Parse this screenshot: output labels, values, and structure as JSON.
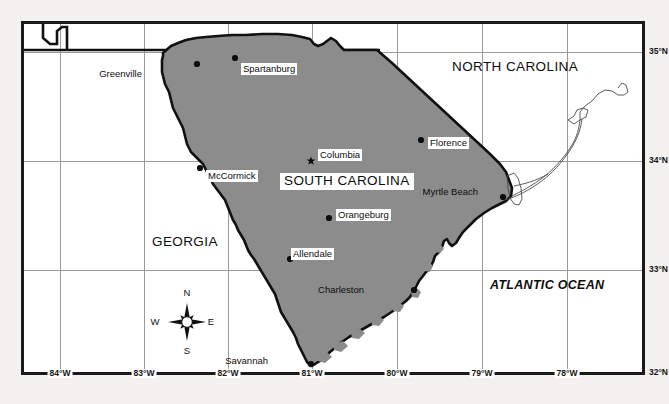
{
  "map": {
    "title": "South Carolina Reference Map",
    "subject_state": "SOUTH CAROLINA",
    "colors": {
      "state_fill": "#8c8c8c",
      "background": "#f2f1ef",
      "border": "#111111",
      "grid": "#9a9a9a",
      "text": "#0d0d0d"
    },
    "extent": {
      "west": -84.6,
      "east": -77.6,
      "south": 31.85,
      "north": 35.35
    }
  },
  "region_labels": [
    {
      "name": "north-carolina",
      "text": "NORTH CAROLINA",
      "x": 452,
      "y": 60,
      "style": "plain"
    },
    {
      "name": "georgia",
      "text": "GEORGIA",
      "x": 152,
      "y": 235,
      "style": "plain"
    },
    {
      "name": "south-carolina",
      "text": "SOUTH CAROLINA",
      "x": 280,
      "y": 173,
      "style": "boxed"
    },
    {
      "name": "atlantic-ocean",
      "text": "ATLANTIC OCEAN",
      "x": 490,
      "y": 279,
      "style": "ocean"
    }
  ],
  "cities": [
    {
      "name": "greenville",
      "label": "Greenville",
      "dot_x": 197,
      "dot_y": 64,
      "label_x": 144,
      "label_y": 68,
      "marker": "dot",
      "label_side": "left"
    },
    {
      "name": "spartanburg",
      "label": "Spartanburg",
      "dot_x": 235,
      "dot_y": 58,
      "label_x": 241,
      "label_y": 63,
      "marker": "dot",
      "label_side": "right"
    },
    {
      "name": "mccormick",
      "label": "McCormick",
      "dot_x": 200,
      "dot_y": 168,
      "label_x": 206,
      "label_y": 170,
      "marker": "dot",
      "label_side": "right"
    },
    {
      "name": "columbia",
      "label": "Columbia",
      "dot_x": 311,
      "dot_y": 161,
      "label_x": 318,
      "label_y": 149,
      "marker": "star",
      "label_side": "right"
    },
    {
      "name": "florence",
      "label": "Florence",
      "dot_x": 421,
      "dot_y": 140,
      "label_x": 428,
      "label_y": 137,
      "marker": "dot",
      "label_side": "right"
    },
    {
      "name": "myrtle-beach",
      "label": "Myrtle Beach",
      "dot_x": 503,
      "dot_y": 197,
      "label_x": 478,
      "label_y": 187,
      "marker": "dot",
      "label_side": "left"
    },
    {
      "name": "orangeburg",
      "label": "Orangeburg",
      "dot_x": 329,
      "dot_y": 218,
      "label_x": 336,
      "label_y": 209,
      "marker": "dot",
      "label_side": "right"
    },
    {
      "name": "allendale",
      "label": "Allendale",
      "dot_x": 290,
      "dot_y": 259,
      "label_x": 291,
      "label_y": 248,
      "marker": "dot",
      "label_side": "right"
    },
    {
      "name": "charleston",
      "label": "Charleston",
      "dot_x": 414,
      "dot_y": 290,
      "label_x": 364,
      "label_y": 285,
      "marker": "dot",
      "label_side": "left"
    },
    {
      "name": "savannah",
      "label": "Savannah",
      "dot_x": 311,
      "dot_y": 364,
      "label_x": 268,
      "label_y": 356,
      "marker": "dot",
      "label_side": "left"
    }
  ],
  "graticule": {
    "longitudes": [
      {
        "label": "84°W",
        "value": -84,
        "x": 60
      },
      {
        "label": "83°W",
        "value": -83,
        "x": 144
      },
      {
        "label": "82°W",
        "value": -82,
        "x": 228
      },
      {
        "label": "81°W",
        "value": -81,
        "x": 312
      },
      {
        "label": "80°W",
        "value": -80,
        "x": 397
      },
      {
        "label": "79°W",
        "value": -79,
        "x": 482
      },
      {
        "label": "78°W",
        "value": -78,
        "x": 567
      }
    ],
    "latitudes": [
      {
        "label": "35°N",
        "value": 35,
        "y": 52
      },
      {
        "label": "34°N",
        "value": 34,
        "y": 161
      },
      {
        "label": "33°N",
        "value": 33,
        "y": 270
      },
      {
        "label": "32°N",
        "value": 32,
        "y": 373
      }
    ]
  },
  "compass": {
    "name": "compass-rose",
    "cx": 187,
    "cy": 322,
    "north": "N",
    "south": "S",
    "east": "E",
    "west": "W"
  }
}
